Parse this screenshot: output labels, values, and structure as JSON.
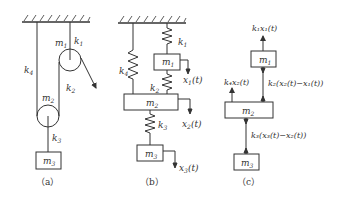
{
  "figure": {
    "panels": [
      {
        "id": "a",
        "caption": "（a）",
        "labels": {
          "m1": "m",
          "m1_sub": "1",
          "m2": "m",
          "m2_sub": "2",
          "m3": "m",
          "m3_sub": "3",
          "k1": "k",
          "k1_sub": "1",
          "k2": "k",
          "k2_sub": "2",
          "k3": "k",
          "k3_sub": "3",
          "k4": "k",
          "k4_sub": "4"
        }
      },
      {
        "id": "b",
        "caption": "（b）",
        "labels": {
          "m1": "m",
          "m1_sub": "1",
          "m2": "m",
          "m2_sub": "2",
          "m3": "m",
          "m3_sub": "3",
          "k1": "k",
          "k1_sub": "1",
          "k2": "k",
          "k2_sub": "2",
          "k3": "k",
          "k3_sub": "3",
          "k4": "k",
          "k4_sub": "4",
          "x1": "x",
          "x1_sub": "1",
          "x1_arg": "(t)",
          "x2": "x",
          "x2_sub": "2",
          "x2_arg": "(t)",
          "x3": "x",
          "x3_sub": "3",
          "x3_arg": "(t)"
        }
      },
      {
        "id": "c",
        "caption": "（c）",
        "labels": {
          "m1": "m",
          "m1_sub": "1",
          "m2": "m",
          "m2_sub": "2",
          "m3": "m",
          "m3_sub": "3",
          "f1": "k₁x₁(t)",
          "f2": "k₂(x₂(t)−x₁(t))",
          "f3": "k₄x₂(t)",
          "f4": "k₃(x₃(t)−x₂(t))"
        }
      }
    ],
    "line_color": "#333333"
  }
}
